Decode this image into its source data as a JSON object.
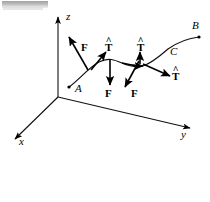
{
  "figure": {
    "background_color": "#ffffff",
    "ink_color": "#000000",
    "smudge_color": "#9a9a9a",
    "axes": [
      {
        "name": "z-axis",
        "label": "z",
        "label_x": 66,
        "label_y": 13,
        "x1": 58,
        "y1": 97,
        "x2": 58,
        "y2": 17
      },
      {
        "name": "y-axis",
        "label": "y",
        "label_x": 181,
        "label_y": 131,
        "x1": 58,
        "y1": 97,
        "x2": 190,
        "y2": 128
      },
      {
        "name": "x-axis",
        "label": "x",
        "label_x": 19,
        "label_y": 138,
        "x1": 58,
        "y1": 97,
        "x2": 14,
        "y2": 140
      }
    ],
    "points": [
      {
        "name": "point-A",
        "label": "A",
        "x": 69,
        "y": 87,
        "label_x": 75,
        "label_y": 85
      },
      {
        "name": "point-B",
        "label": "B",
        "x": 199,
        "y": 37,
        "label_x": 192,
        "label_y": 22
      },
      {
        "name": "point-C",
        "label": "C",
        "x": 178,
        "y": 60,
        "label_x": 170,
        "label_y": 47
      }
    ],
    "curve": {
      "name": "space-curve",
      "path": "M 69,87 C 79,80 88,68 99,62 C 108,57 115,60 122,63 C 129,66 136,68 143,66 C 152,63 160,56 168,49 C 178,42 190,38 199,37"
    },
    "force_vectors": [
      {
        "name": "force-vector-1",
        "label": "F",
        "x1": 88,
        "y1": 70,
        "x2": 68,
        "y2": 36,
        "label_x": 81,
        "label_y": 45
      },
      {
        "name": "force-vector-2",
        "label": "F",
        "x1": 110,
        "y1": 60,
        "x2": 110,
        "y2": 86,
        "label_x": 106,
        "label_y": 90
      },
      {
        "name": "force-vector-3",
        "label": "F",
        "x1": 139,
        "y1": 61,
        "x2": 124,
        "y2": 88,
        "label_x": 131,
        "label_y": 89
      }
    ],
    "tangent_vectors": [
      {
        "name": "tangent-vector-1",
        "symbol": "T",
        "hat": "^",
        "x1": 91,
        "y1": 70,
        "x2": 105,
        "y2": 52,
        "label_x": 106,
        "label_y": 44
      },
      {
        "name": "tangent-vector-2",
        "symbol": "T",
        "hat": "^",
        "x1": 140,
        "y1": 63,
        "x2": 140,
        "y2": 51,
        "label_x": 138,
        "label_y": 44
      },
      {
        "name": "tangent-vector-3",
        "symbol": "T",
        "hat": "^",
        "x1": 143,
        "y1": 64,
        "x2": 170,
        "y2": 76,
        "label_x": 172,
        "label_y": 72
      }
    ],
    "tangent_arrow_on_curve": {
      "name": "curve-direction-arrow",
      "x1": 122,
      "y1": 63,
      "x2": 144,
      "y2": 66
    }
  }
}
